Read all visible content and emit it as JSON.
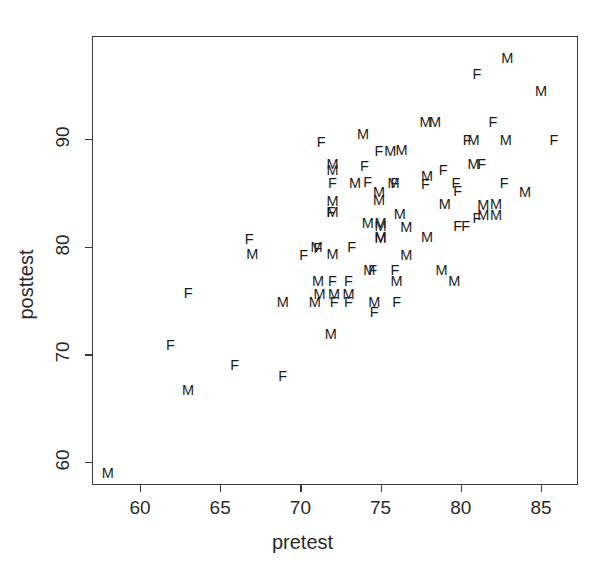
{
  "chart_data": {
    "type": "scatter",
    "title": "",
    "xlabel": "pretest",
    "ylabel": "posttest",
    "xlim": [
      57,
      87
    ],
    "ylim": [
      57.5,
      99
    ],
    "grid": false,
    "legend": "none",
    "marker_encoding": "text glyph of sex: M = male, F = female",
    "xticks": [
      60,
      65,
      70,
      75,
      80,
      85
    ],
    "xticklabels": [
      "60",
      "65",
      "70",
      "75",
      "80",
      "85"
    ],
    "yticks": [
      60,
      70,
      80,
      90
    ],
    "yticklabels": [
      "60",
      "70",
      "80",
      "90"
    ],
    "series": [
      {
        "name": "M",
        "label": "M",
        "points": [
          [
            58.0,
            59.0
          ],
          [
            63.0,
            66.7
          ],
          [
            67.0,
            79.3
          ],
          [
            68.9,
            74.9
          ],
          [
            70.9,
            74.9
          ],
          [
            71.0,
            80.0
          ],
          [
            71.1,
            76.8
          ],
          [
            71.2,
            75.6
          ],
          [
            71.9,
            71.9
          ],
          [
            72.0,
            87.7
          ],
          [
            72.0,
            87.1
          ],
          [
            72.0,
            84.2
          ],
          [
            72.0,
            83.2
          ],
          [
            72.0,
            79.3
          ],
          [
            72.1,
            75.6
          ],
          [
            73.0,
            75.6
          ],
          [
            73.4,
            85.9
          ],
          [
            73.9,
            90.5
          ],
          [
            74.2,
            82.2
          ],
          [
            74.3,
            77.8
          ],
          [
            74.6,
            74.9
          ],
          [
            74.9,
            85.1
          ],
          [
            74.9,
            84.3
          ],
          [
            75.0,
            81.9
          ],
          [
            75.0,
            82.2
          ],
          [
            75.0,
            80.9
          ],
          [
            75.0,
            80.8
          ],
          [
            75.6,
            88.9
          ],
          [
            75.8,
            85.9
          ],
          [
            76.0,
            76.8
          ],
          [
            76.2,
            83.0
          ],
          [
            76.3,
            89.0
          ],
          [
            76.6,
            81.8
          ],
          [
            76.6,
            79.2
          ],
          [
            77.8,
            91.6
          ],
          [
            78.4,
            91.6
          ],
          [
            77.9,
            86.6
          ],
          [
            77.9,
            80.9
          ],
          [
            78.8,
            77.8
          ],
          [
            79.0,
            84.0
          ],
          [
            79.6,
            76.8
          ],
          [
            80.8,
            89.9
          ],
          [
            80.8,
            87.7
          ],
          [
            81.4,
            83.9
          ],
          [
            81.4,
            82.9
          ],
          [
            82.2,
            84.0
          ],
          [
            82.2,
            82.9
          ],
          [
            82.8,
            89.9
          ],
          [
            82.9,
            97.5
          ],
          [
            84.0,
            85.1
          ],
          [
            85.0,
            94.5
          ]
        ]
      },
      {
        "name": "F",
        "label": "F",
        "points": [
          [
            61.9,
            70.9
          ],
          [
            65.9,
            69.0
          ],
          [
            66.8,
            80.7
          ],
          [
            63.0,
            75.7
          ],
          [
            68.9,
            68.0
          ],
          [
            70.2,
            79.2
          ],
          [
            71.1,
            79.9
          ],
          [
            71.3,
            89.7
          ],
          [
            72.0,
            85.9
          ],
          [
            72.1,
            74.9
          ],
          [
            73.0,
            76.8
          ],
          [
            72.0,
            76.8
          ],
          [
            71.9,
            83.2
          ],
          [
            73.0,
            74.9
          ],
          [
            73.2,
            80.0
          ],
          [
            74.0,
            87.5
          ],
          [
            74.2,
            86.0
          ],
          [
            74.5,
            77.8
          ],
          [
            74.6,
            73.9
          ],
          [
            74.9,
            88.9
          ],
          [
            75.9,
            85.9
          ],
          [
            75.9,
            77.8
          ],
          [
            76.0,
            74.9
          ],
          [
            77.8,
            85.8
          ],
          [
            78.9,
            87.1
          ],
          [
            79.7,
            85.9
          ],
          [
            79.8,
            85.2
          ],
          [
            79.8,
            81.9
          ],
          [
            80.3,
            81.9
          ],
          [
            80.4,
            89.9
          ],
          [
            81.0,
            82.7
          ],
          [
            81.3,
            87.7
          ],
          [
            81.0,
            96.0
          ],
          [
            82.0,
            91.6
          ],
          [
            82.7,
            85.9
          ],
          [
            85.8,
            89.9
          ]
        ]
      }
    ]
  },
  "axes": {
    "x_title": "pretest",
    "y_title": "posttest"
  }
}
